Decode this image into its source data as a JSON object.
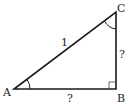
{
  "diagram": {
    "type": "right-triangle",
    "vertices": {
      "A": {
        "label": "A",
        "x": 14,
        "y": 89
      },
      "B": {
        "label": "B",
        "x": 116,
        "y": 89
      },
      "C": {
        "label": "C",
        "x": 116,
        "y": 12
      }
    },
    "sides": {
      "hypotenuse_AC": {
        "label": "1"
      },
      "leg_BC": {
        "label": "?"
      },
      "leg_AB": {
        "label": "?"
      }
    },
    "markers": {
      "right_angle_at": "B",
      "angle_arcs_at": [
        "A",
        "C"
      ]
    },
    "colors": {
      "stroke": "#1a1a1a",
      "text": "#222222",
      "background": "#ffffff"
    }
  }
}
